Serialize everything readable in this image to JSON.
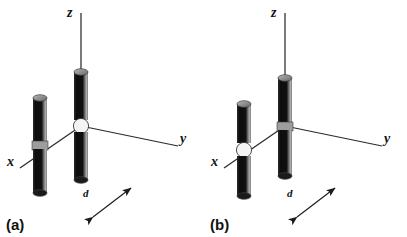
{
  "figure": {
    "width": 407,
    "height": 237,
    "background_color": "#ffffff"
  },
  "colors": {
    "rod_dark": "#151515",
    "rod_highlight": "#9a9a9a",
    "rod_cap": "#8c8c8c",
    "rod_cap_edge": "#444444",
    "feed_gap": "#f2f2f2",
    "axis_line": "#2a2a2a",
    "text": "#111111"
  },
  "panels": [
    {
      "id": "a",
      "label": "(a)",
      "axes": {
        "z": {
          "label": "z"
        },
        "y": {
          "label": "y"
        },
        "x": {
          "label": "x"
        }
      },
      "spacing": {
        "label": "d"
      },
      "elements": [
        {
          "name": "left-dipole",
          "role": "parasitic",
          "fed": false
        },
        {
          "name": "right-dipole",
          "role": "driven",
          "fed": true
        }
      ],
      "driven_element": "right-dipole",
      "origin_on": "right-dipole"
    },
    {
      "id": "b",
      "label": "(b)",
      "axes": {
        "z": {
          "label": "z"
        },
        "y": {
          "label": "y"
        },
        "x": {
          "label": "x"
        }
      },
      "spacing": {
        "label": "d"
      },
      "elements": [
        {
          "name": "left-dipole",
          "role": "driven",
          "fed": true
        },
        {
          "name": "right-dipole",
          "role": "parasitic",
          "fed": false
        }
      ],
      "driven_element": "left-dipole",
      "origin_on": "left-dipole"
    }
  ]
}
